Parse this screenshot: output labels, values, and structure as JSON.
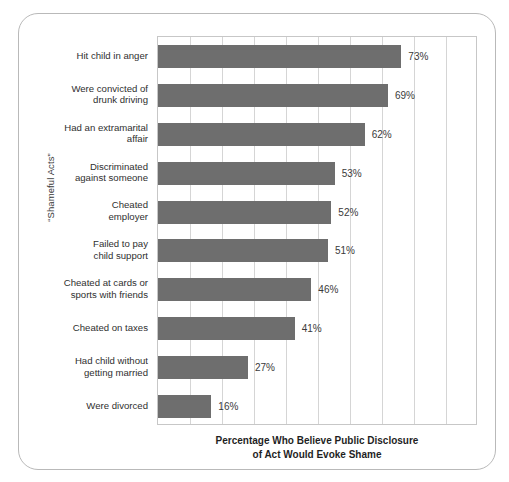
{
  "chart_data": {
    "type": "bar",
    "orientation": "horizontal",
    "title": "",
    "xlabel": "Percentage Who Believe Public Disclosure of Act Would Evoke Shame",
    "xlabel_lines": [
      "Percentage Who Believe Public Disclosure",
      "of Act Would Evoke Shame"
    ],
    "ylabel": "“Shameful Acts”",
    "categories": [
      "Hit child in anger",
      "Were convicted of drunk driving",
      "Had an extramarital affair",
      "Discriminated against someone",
      "Cheated employer",
      "Failed to pay child support",
      "Cheated at cards or sports with friends",
      "Cheated on taxes",
      "Had child without getting married",
      "Were divorced"
    ],
    "category_lines": [
      [
        "Hit child in anger"
      ],
      [
        "Were convicted of",
        "drunk driving"
      ],
      [
        "Had an extramarital",
        "affair"
      ],
      [
        "Discriminated",
        "against someone"
      ],
      [
        "Cheated",
        "employer"
      ],
      [
        "Failed to pay",
        "child support"
      ],
      [
        "Cheated at cards or",
        "sports with friends"
      ],
      [
        "Cheated on taxes"
      ],
      [
        "Had child without",
        "getting married"
      ],
      [
        "Were divorced"
      ]
    ],
    "values": [
      73,
      69,
      62,
      53,
      52,
      51,
      46,
      41,
      27,
      16
    ],
    "value_labels": [
      "73%",
      "69%",
      "62%",
      "53%",
      "52%",
      "51%",
      "46%",
      "41%",
      "27%",
      "16%"
    ],
    "xlim": [
      0,
      96
    ],
    "gridlines_x": [
      9.6,
      19.2,
      28.8,
      38.4,
      48,
      57.6,
      67.2,
      76.8,
      86.4
    ],
    "grid": true,
    "legend": false,
    "bar_color": "#6e6e6e",
    "grid_color": "#d5d5d5",
    "axis_color": "#c7c7c7",
    "frame_color": "#b9b9b9",
    "text_color": "#2f2f2f"
  }
}
